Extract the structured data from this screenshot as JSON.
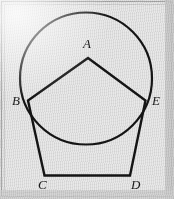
{
  "figure": {
    "kind": "geometry-diagram",
    "canvas": {
      "width": 174,
      "height": 199
    },
    "background_color": "#e9e9e9",
    "stroke_color": "#151515",
    "frame_color": "#a8a8a8",
    "circle": {
      "name": "circumscribing-circle",
      "cx": 86,
      "cy": 78.5,
      "r": 66,
      "stroke_width": 2.2
    },
    "polygon": {
      "name": "pentagon-abcde",
      "stroke_width": 2.4,
      "points": "88,58 28,100.5 44.5,175.5 130,175.5 145.5,100.5"
    },
    "segments": [
      {
        "name": "segment-ab",
        "x1": 88,
        "y1": 58,
        "x2": 28,
        "y2": 100.5
      },
      {
        "name": "segment-ae",
        "x1": 88,
        "y1": 58,
        "x2": 145.5,
        "y2": 100.5
      },
      {
        "name": "segment-bc",
        "x1": 28,
        "y1": 100.5,
        "x2": 44.5,
        "y2": 175.5
      },
      {
        "name": "segment-cd",
        "x1": 44.5,
        "y1": 175.5,
        "x2": 130,
        "y2": 175.5
      },
      {
        "name": "segment-de",
        "x1": 130,
        "y1": 175.5,
        "x2": 145.5,
        "y2": 100.5
      }
    ],
    "vertices": [
      {
        "name": "vertex-a",
        "label": "A",
        "x": 88,
        "y": 58,
        "label_x": 83,
        "label_y": 37
      },
      {
        "name": "vertex-b",
        "label": "B",
        "x": 28,
        "y": 100.5,
        "label_x": 12,
        "label_y": 94
      },
      {
        "name": "vertex-c",
        "label": "C",
        "x": 44.5,
        "y": 175.5,
        "label_x": 38,
        "label_y": 178
      },
      {
        "name": "vertex-d",
        "label": "D",
        "x": 130,
        "y": 175.5,
        "label_x": 131,
        "label_y": 178
      },
      {
        "name": "vertex-e",
        "label": "E",
        "x": 145.5,
        "y": 100.5,
        "label_x": 152,
        "label_y": 94
      }
    ]
  }
}
